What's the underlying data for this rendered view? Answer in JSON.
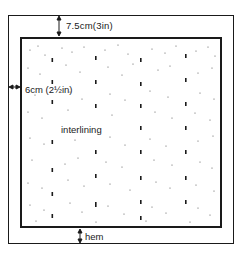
{
  "diagram": {
    "type": "sewing-construction",
    "labels": {
      "top_margin": "7.5cm(3in)",
      "side_margin": "6cm (2½in)",
      "interlining": "interlining",
      "hem": "hem"
    },
    "regions": [
      {
        "name": "outer-fabric",
        "description": "outer rectangle (curtain fabric)"
      },
      {
        "name": "interlining-panel",
        "description": "inner dotted rectangle",
        "pattern": "stipple with vertical rows of bold dashes"
      }
    ],
    "colors": {
      "ink": "#1a1a1a",
      "paper": "#ffffff"
    }
  }
}
